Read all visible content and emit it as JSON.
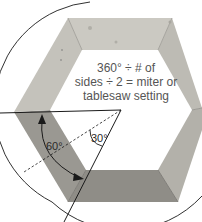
{
  "diagram": {
    "caption_lines": [
      "360° ÷ # of",
      "sides ÷ 2 = miter or",
      "tablesaw setting"
    ],
    "angles": {
      "outer_angle_label": "60°",
      "miter_angle_label": "30°"
    },
    "colors": {
      "wood_light": "#c9c7c0",
      "wood_mid": "#a9a7a0",
      "wood_dark": "#8e8c86",
      "line": "#1a1a1a",
      "background": "#ffffff"
    }
  }
}
